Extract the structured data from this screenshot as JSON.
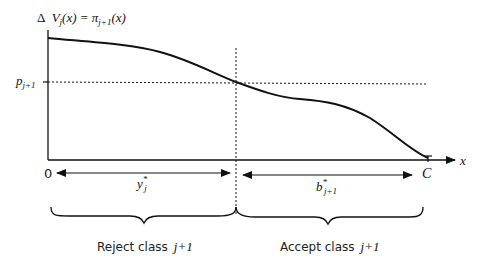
{
  "diagram": {
    "y_axis_label": {
      "delta": "Δ",
      "V": "V",
      "V_sub": "j",
      "arg": "(x) = π",
      "pi_sub": "j+1",
      "arg2": "(x)"
    },
    "x_axis_label": "x",
    "origin_label": "0",
    "capacity_label": "C",
    "price_label": {
      "p": "p",
      "sub": "j+1"
    },
    "protection_level": {
      "base": "y",
      "sup": "*",
      "sub": "j"
    },
    "booking_limit": {
      "base": "b",
      "sup": "*",
      "sub": "j+1"
    },
    "regions": [
      {
        "label": "Reject class",
        "class_label": "j+1"
      },
      {
        "label": "Accept class",
        "class_label": "j+1"
      }
    ],
    "curve": {
      "description": "decreasing marginal value curve crossing p_{j+1} at y*_j",
      "points": [
        [
          48,
          38
        ],
        [
          120,
          45
        ],
        [
          180,
          62
        ],
        [
          236,
          82
        ],
        [
          280,
          95
        ],
        [
          320,
          100
        ],
        [
          360,
          115
        ],
        [
          400,
          145
        ],
        [
          428,
          158
        ]
      ]
    },
    "colors": {
      "line": "#111111",
      "text": "#222222",
      "background": "#ffffff"
    }
  }
}
